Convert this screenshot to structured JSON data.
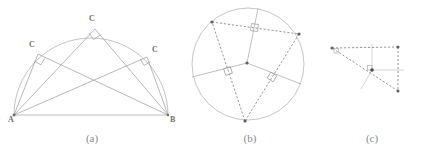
{
  "figure_set": {
    "background_color": "#ffffff",
    "width": 431,
    "height": 153,
    "stroke_color": "#9a9a9a",
    "dash_color": "#8c8c8c",
    "faint_color": "#c8c8c8",
    "point_color": "#6b6b6b",
    "label_color": "#6f6f6f",
    "caption_color": "#8a8a8a"
  },
  "captions": {
    "a": "(a)",
    "b": "(b)",
    "c": "(c)"
  },
  "figure_a": {
    "title": "Thales inscribed right angle in a semicircle",
    "points": {
      "A": {
        "label": "A",
        "x": 14,
        "y": 115
      },
      "B": {
        "label": "B",
        "x": 168,
        "y": 115
      },
      "C1": {
        "label": "C",
        "x": 38,
        "y": 54
      },
      "C2": {
        "label": "C",
        "x": 95,
        "y": 29
      },
      "C3": {
        "label": "C",
        "x": 147,
        "y": 57
      }
    },
    "semicircle": {
      "cx": 91,
      "cy": 115,
      "r": 77
    },
    "right_angle_marks": 3
  },
  "figure_b": {
    "title": "Circumcircle with perpendicular bisectors of the chords",
    "circle": {
      "cx": 248,
      "cy": 64,
      "r": 56
    },
    "center_point": {
      "x": 247,
      "y": 63
    },
    "triangle_vertices": [
      {
        "x": 212,
        "y": 22
      },
      {
        "x": 299,
        "y": 34
      },
      {
        "x": 245,
        "y": 121
      }
    ],
    "midpoints": [
      {
        "x": 255,
        "y": 28
      },
      {
        "x": 272,
        "y": 77
      },
      {
        "x": 228,
        "y": 71
      }
    ],
    "right_angle_marks": 3
  },
  "figure_c": {
    "title": "Obtuse triangle with circumcenter outside",
    "triangle_vertices": [
      {
        "x": 332,
        "y": 48
      },
      {
        "x": 398,
        "y": 47
      },
      {
        "x": 398,
        "y": 91
      }
    ],
    "center_point": {
      "x": 372,
      "y": 70
    },
    "right_angle_marks": 2
  }
}
